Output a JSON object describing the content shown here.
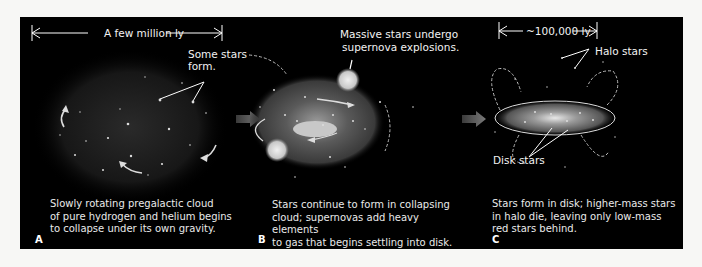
{
  "figure": {
    "stages": [
      {
        "id": "A",
        "letter": "A",
        "scale_label": "A few million ly",
        "annotations": [
          "Some stars",
          "form."
        ],
        "caption": "Slowly rotating pregalactic cloud\nof pure hydrogen and helium begins\nto collapse under its own gravity."
      },
      {
        "id": "B",
        "letter": "B",
        "annotations": [
          "Massive stars undergo",
          "supernova explosions."
        ],
        "caption": "Stars continue to form in collapsing\ncloud; supernovas add heavy elements\nto gas that begins settling into disk."
      },
      {
        "id": "C",
        "letter": "C",
        "scale_label": "~100,000 ly",
        "annotations": [
          "Halo stars",
          "Disk stars"
        ],
        "caption": "Stars form in disk; higher-mass stars\nin halo die, leaving only low-mass\nred stars behind."
      }
    ],
    "colors": {
      "panel_bg": "#000000",
      "page_bg": "#f7f7f5",
      "text": "#f2f2f2",
      "arrow": "#6e6e6e"
    }
  }
}
